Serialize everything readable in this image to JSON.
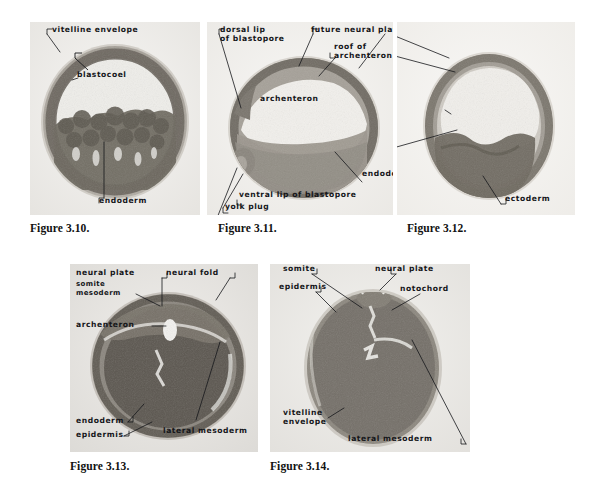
{
  "page": {
    "background_color": "#ffffff",
    "ink_color": "#15161a",
    "caption_color": "#111111"
  },
  "figures": [
    {
      "id": "figure-3-10",
      "caption": "Figure 3.10.",
      "caption_pos": {
        "x": 30,
        "y": 222
      },
      "panel": {
        "x": 30,
        "y": 22,
        "w": 170,
        "h": 193
      },
      "stage": "blastula",
      "tone": {
        "base": "#cfcdc8",
        "cortex": "#8a867e",
        "interior": "#6f6a62",
        "lumen": "#eceae6"
      },
      "labels": [
        {
          "name": "vitelline-envelope",
          "text": "vitelline envelope",
          "x": 46,
          "y": 28,
          "align": "left"
        },
        {
          "name": "blastocoel",
          "text": "blastocoel",
          "x": 71,
          "y": 72,
          "align": "left"
        },
        {
          "name": "endoderm",
          "text": "endoderm",
          "x": 95,
          "y": 196,
          "align": "left"
        }
      ]
    },
    {
      "id": "figure-3-11",
      "caption": "Figure 3.11.",
      "caption_pos": {
        "x": 218,
        "y": 222
      },
      "panel": {
        "x": 207,
        "y": 22,
        "w": 186,
        "h": 193
      },
      "stage": "yolk-plug gastrula",
      "tone": {
        "base": "#d8d6d1",
        "cortex": "#8b877f",
        "interior": "#9a958c",
        "lumen": "#f0eeea"
      },
      "labels": [
        {
          "name": "dorsal-lip-of-blastopore",
          "text": "dorsal lip\nof blastopore",
          "x": 220,
          "y": 28,
          "align": "left"
        },
        {
          "name": "future-neural-plate",
          "text": "future neural plate",
          "x": 311,
          "y": 28,
          "align": "left"
        },
        {
          "name": "roof-of-archenteron",
          "text": "roof of\narchenteron",
          "x": 334,
          "y": 44,
          "align": "left"
        },
        {
          "name": "archenteron",
          "text": "archenteron",
          "x": 260,
          "y": 96,
          "align": "left"
        },
        {
          "name": "endoderm",
          "text": "endoderm",
          "x": 362,
          "y": 170,
          "align": "left"
        },
        {
          "name": "ventral-lip-of-blastopore",
          "text": "ventral lip of blastopore",
          "x": 239,
          "y": 192,
          "align": "left"
        },
        {
          "name": "yolk-plug",
          "text": "yolk plug",
          "x": 225,
          "y": 204,
          "align": "left"
        }
      ]
    },
    {
      "id": "figure-3-12",
      "caption": "Figure 3.12.",
      "caption_pos": {
        "x": 407,
        "y": 222
      },
      "panel": {
        "x": 397,
        "y": 22,
        "w": 178,
        "h": 193
      },
      "stage": "late gastrula / neurula onset",
      "tone": {
        "base": "#dcdad5",
        "cortex": "#8d8981",
        "interior": "#7e7971",
        "lumen": "#f1efeb"
      },
      "labels": [
        {
          "name": "ectoderm",
          "text": "ectoderm",
          "x": 505,
          "y": 196,
          "align": "left"
        }
      ]
    },
    {
      "id": "figure-3-13",
      "caption": "Figure 3.13.",
      "caption_pos": {
        "x": 70,
        "y": 460
      },
      "panel": {
        "x": 70,
        "y": 264,
        "w": 188,
        "h": 188
      },
      "stage": "neural plate / neural fold stage",
      "tone": {
        "base": "#cbc9c4",
        "cortex": "#7f7b73",
        "interior": "#615d56",
        "lumen": "#efeeea"
      },
      "labels": [
        {
          "name": "neural-plate",
          "text": "neural plate",
          "x": 76,
          "y": 270,
          "align": "left"
        },
        {
          "name": "neural-fold",
          "text": "neural fold",
          "x": 166,
          "y": 270,
          "align": "left"
        },
        {
          "name": "somite-mesoderm",
          "text": "somite\nmesoderm",
          "x": 76,
          "y": 282,
          "align": "left"
        },
        {
          "name": "archenteron",
          "text": "archenteron",
          "x": 76,
          "y": 322,
          "align": "left"
        },
        {
          "name": "endoderm",
          "text": "endoderm",
          "x": 76,
          "y": 418,
          "align": "left"
        },
        {
          "name": "epidermis",
          "text": "epidermis",
          "x": 76,
          "y": 433,
          "align": "left"
        },
        {
          "name": "lateral-mesoderm",
          "text": "lateral mesoderm",
          "x": 163,
          "y": 428,
          "align": "left"
        }
      ]
    },
    {
      "id": "figure-3-14",
      "caption": "Figure 3.14.",
      "caption_pos": {
        "x": 270,
        "y": 460
      },
      "panel": {
        "x": 270,
        "y": 264,
        "w": 200,
        "h": 188
      },
      "stage": "neural tube / notochord stage",
      "tone": {
        "base": "#d2d0cb",
        "cortex": "#86827a",
        "interior": "#6d685f",
        "lumen": "#efeeea"
      },
      "labels": [
        {
          "name": "somite",
          "text": "somite",
          "x": 283,
          "y": 268,
          "align": "left"
        },
        {
          "name": "neural-plate",
          "text": "neural plate",
          "x": 375,
          "y": 268,
          "align": "left"
        },
        {
          "name": "epidermis",
          "text": "epidermis",
          "x": 279,
          "y": 286,
          "align": "left"
        },
        {
          "name": "notochord",
          "text": "notochord",
          "x": 400,
          "y": 288,
          "align": "left"
        },
        {
          "name": "vitelline-envelope",
          "text": "vitelline\nenvelope",
          "x": 283,
          "y": 412,
          "align": "left"
        },
        {
          "name": "lateral-mesoderm",
          "text": "lateral mesoderm",
          "x": 348,
          "y": 440,
          "align": "left"
        }
      ]
    }
  ]
}
